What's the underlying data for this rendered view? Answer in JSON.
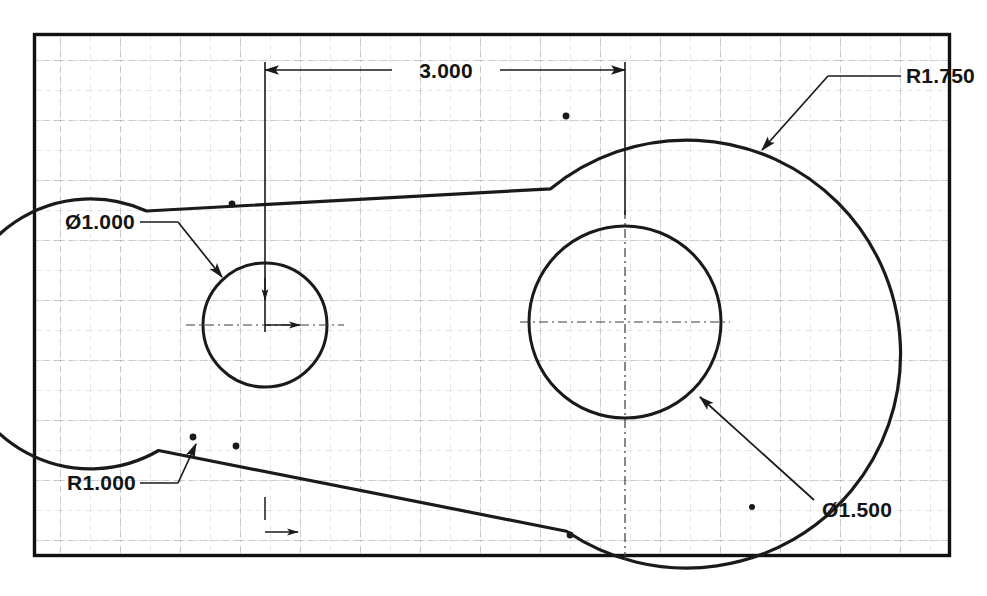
{
  "drawing": {
    "title": "Mechanical Part Outline Drawing",
    "sheet": {
      "background_color": "#ffffff",
      "border_color": "#111111",
      "grid_minor_color": "#c9c9c9",
      "grid_major_color": "#a8a8a8",
      "line_color": "#1a1a1a",
      "frame": {
        "x": 33,
        "y": 33,
        "width": 918,
        "height": 524
      },
      "grid_minor_spacing": 30,
      "grid_major_spacing": 60
    },
    "geometry": {
      "small_hole": {
        "cx": 265,
        "cy": 325,
        "r": 62,
        "label": "small-hole"
      },
      "large_hole": {
        "cx": 625,
        "cy": 322,
        "r": 96,
        "label": "large-hole"
      },
      "left_arc": {
        "cx": 265,
        "cy": 325,
        "r": 135,
        "label": "left-fillet-arc"
      },
      "right_arc": {
        "cx": 625,
        "cy": 322,
        "r": 214,
        "label": "right-fillet-arc"
      },
      "center_distance_px": 360
    },
    "dimensions": [
      {
        "id": "overall-length",
        "name": "dimension-3000",
        "value": "3.000",
        "type": "linear",
        "from": "small-hole-center",
        "to": "large-hole-center"
      },
      {
        "id": "small-hole-dia",
        "name": "dimension-dia-1000",
        "value": "Ø1.000",
        "type": "diameter",
        "applies_to": "small-hole"
      },
      {
        "id": "large-hole-dia",
        "name": "dimension-dia-1500",
        "value": "Ø1.500",
        "type": "diameter",
        "applies_to": "large-hole"
      },
      {
        "id": "left-radius",
        "name": "dimension-r1000",
        "value": "R1.000",
        "type": "radius",
        "applies_to": "left-fillet-arc"
      },
      {
        "id": "right-radius",
        "name": "dimension-r1750",
        "value": "R1.750",
        "type": "radius",
        "applies_to": "right-fillet-arc"
      }
    ],
    "labels": {
      "overall_length": "3.000",
      "small_hole_diameter": "Ø1.000",
      "large_hole_diameter": "Ø1.500",
      "left_radius": "R1.000",
      "right_radius": "R1.750"
    }
  }
}
